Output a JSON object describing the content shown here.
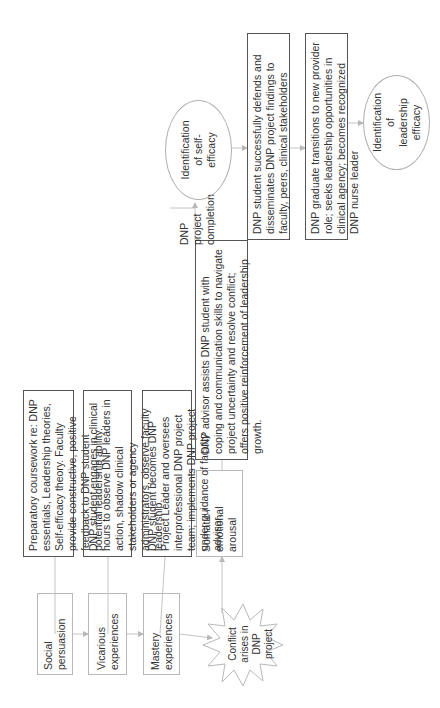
{
  "diagram": {
    "orientation": "rotated-90-ccw",
    "sources": [
      {
        "id": "social",
        "label": "Social persuasion"
      },
      {
        "id": "vicarious",
        "label": "Vicarious experiences"
      },
      {
        "id": "mastery",
        "label": "Mastery experiences"
      },
      {
        "id": "somatic",
        "label": "Somatic / emotional arousal"
      }
    ],
    "conflict": {
      "label": "Conflict arises in DNP project"
    },
    "descriptions": [
      {
        "id": "prep",
        "text": "Preparatory coursework re: DNP essentials, Leadership theories, Self-efficacy theory. Faculty provide constructive, positive feedback to DNP student potential leadership ability."
      },
      {
        "id": "clinical",
        "text": "DNP student engages in clinical hours to observe DNP leaders in action, shadow clinical stakeholders or agency administrators, observe faculty leadership."
      },
      {
        "id": "leader",
        "text": "DNP student becomes DNP Project Leader and oversees interprofessional DNP project team; implements DNP project under guidance of faculty advisor."
      },
      {
        "id": "advisor",
        "text": "DNP advisor assists DNP student with coping and communication skills to navigate project uncertainty and resolve conflict; offers positive reinforcement of leadership growth."
      },
      {
        "id": "defends",
        "text": "DNP student successfully defends and disseminates DNP project findings to faculty, peers, clinical stakeholders"
      },
      {
        "id": "graduate",
        "text": "DNP graduate transitions to new provider role; seeks leadership opportunities in clinical agency; becomes recognized DNP nurse leader"
      }
    ],
    "completion_label": "DNP project completion",
    "outcomes": [
      {
        "id": "self-efficacy",
        "label": "Identification of self-efficacy"
      },
      {
        "id": "leadership-efficacy",
        "label": "Identification of leadership efficacy"
      }
    ]
  },
  "colors": {
    "line": "#b8b8b8",
    "dark_border": "#555555",
    "text": "#333333"
  }
}
